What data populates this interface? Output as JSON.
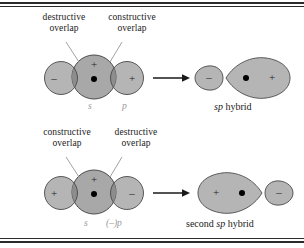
{
  "figure": {
    "colors": {
      "orbital_fill": "#b5b5b5",
      "orbital_fill_dark": "#9a9a9a",
      "overlap_dark": "#8a8a8a",
      "outline": "#4a4a4a",
      "rule": "#2b2b2b",
      "label_gray": "#9a9a9a",
      "text": "#1a1a1a",
      "nucleus": "#000000"
    }
  },
  "rows": [
    {
      "id": "row-top",
      "annotations": [
        {
          "id": "annot-destructive-top",
          "line1": "destructive",
          "line2": "overlap"
        },
        {
          "id": "annot-constructive-top",
          "line1": "constructive",
          "line2": "overlap"
        }
      ],
      "reactant_signs": {
        "left_lobe": "–",
        "center": "+",
        "right_lobe": "+"
      },
      "orbital_labels": [
        {
          "id": "label-s-top",
          "text": "s"
        },
        {
          "id": "label-p-top",
          "text": "p"
        }
      ],
      "arrow": "→",
      "product": {
        "small_lobe_sign": "–",
        "large_lobe_sign": "+",
        "caption_italic": "sp",
        "caption_rest": " hybrid"
      }
    },
    {
      "id": "row-bottom",
      "annotations": [
        {
          "id": "annot-constructive-bottom",
          "line1": "constructive",
          "line2": "overlap"
        },
        {
          "id": "annot-destructive-bottom",
          "line1": "destructive",
          "line2": "overlap"
        }
      ],
      "reactant_signs": {
        "left_lobe": "+",
        "center": "+",
        "right_lobe": "–"
      },
      "orbital_labels": [
        {
          "id": "label-s-bottom",
          "text": "s"
        },
        {
          "id": "label-p-bottom",
          "text": "(–)p"
        }
      ],
      "arrow": "→",
      "product": {
        "small_lobe_sign": "–",
        "large_lobe_sign": "+",
        "caption_lead": "second ",
        "caption_italic": "sp",
        "caption_rest": " hybrid"
      }
    }
  ]
}
